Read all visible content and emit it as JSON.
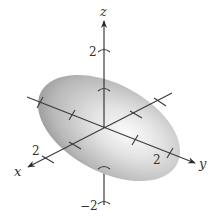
{
  "figure": {
    "type": "3d-ellipsoid-plot",
    "axes": {
      "x": {
        "label": "x",
        "tick_label": "2"
      },
      "y": {
        "label": "y",
        "tick_label": "2"
      },
      "z": {
        "label": "z",
        "tick_top": "2",
        "tick_bottom": "−2"
      }
    },
    "colors": {
      "axis": "#2a2a2a",
      "surface_light": "#f4f4f4",
      "surface_mid": "#c8c8c8",
      "surface_dark": "#8e8e8e",
      "label": "#333333"
    }
  }
}
